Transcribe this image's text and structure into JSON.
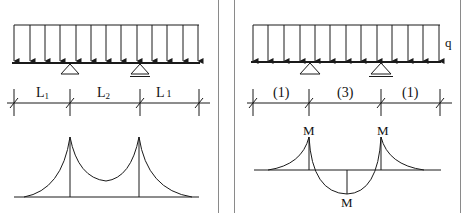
{
  "colors": {
    "ink": "#1a1a1a",
    "frame": "#8a8a8a",
    "background": "#ffffff"
  },
  "left_panel": {
    "span_labels": [
      {
        "main": "L",
        "sub": "1"
      },
      {
        "main": "L",
        "sub": "2"
      },
      {
        "main": "L",
        "sub": "1"
      }
    ],
    "supports": [
      "pin-support",
      "roller-support"
    ],
    "diagram": "moment diagram with two hogging peaks at supports"
  },
  "right_panel": {
    "load_label": "q",
    "span_labels": [
      "(1)",
      "(3)",
      "(1)"
    ],
    "moment_labels": [
      "M",
      "M",
      "M"
    ],
    "supports": [
      "pin-support",
      "roller-support"
    ],
    "diagram": "moment diagram with negative moments at supports and positive midspan moment"
  }
}
